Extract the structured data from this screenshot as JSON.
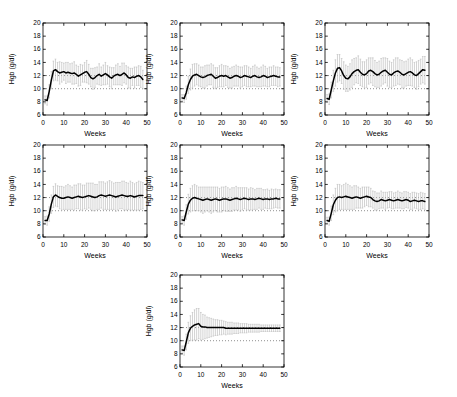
{
  "figure": {
    "background": "#ffffff",
    "axis_color": "#000000",
    "line_color": "#000000",
    "error_bar_color": "#c0c0c0",
    "reference_line_color": "#4a4a4a",
    "xlabel": "Weeks",
    "ylabel": "Hgb (g/dl)"
  },
  "chart_data": [
    {
      "type": "line",
      "xlabel": "Weeks",
      "ylabel": "Hgb (g/dl)",
      "xlim": [
        0,
        50
      ],
      "ylim": [
        6,
        20
      ],
      "xticks": [
        0,
        10,
        20,
        30,
        40,
        50
      ],
      "yticks": [
        6,
        8,
        10,
        12,
        14,
        16,
        18,
        20
      ],
      "reference_lines_y": [
        10,
        12
      ],
      "x": {
        "start": 1,
        "step": 1
      },
      "mean": [
        8.3,
        8.2,
        9.6,
        11.3,
        12.7,
        12.9,
        12.6,
        12.4,
        12.5,
        12.6,
        12.4,
        12.5,
        12.4,
        12.3,
        12.4,
        12.2,
        11.9,
        12.1,
        12.3,
        12.5,
        12.6,
        12.2,
        11.7,
        11.5,
        11.7,
        12.0,
        12.2,
        11.9,
        12.1,
        12.3,
        12.1,
        11.8,
        11.6,
        11.9,
        12.1,
        12.2,
        12.0,
        12.2,
        12.4,
        12.1,
        11.7,
        11.6,
        11.8,
        11.7,
        11.9,
        12.0,
        11.8,
        11.4
      ],
      "error_half_width": [
        0.6,
        0.7,
        1.0,
        1.3,
        1.5,
        1.6,
        1.4,
        1.7,
        1.5,
        1.3,
        1.6,
        1.5,
        1.4,
        1.6,
        1.7,
        1.4,
        1.5,
        1.6,
        1.3,
        1.5,
        1.7,
        1.5,
        1.4,
        1.6,
        1.5,
        1.3,
        1.6,
        1.4,
        1.5,
        1.7,
        1.4,
        1.5,
        1.6,
        1.3,
        1.5,
        1.6,
        1.4,
        1.7,
        1.5,
        1.4,
        1.6,
        1.5,
        1.3,
        1.6,
        1.4,
        1.5,
        1.6,
        1.4
      ]
    },
    {
      "type": "line",
      "xlabel": "Weeks",
      "ylabel": "Hgb (g/dl)",
      "xlim": [
        0,
        50
      ],
      "ylim": [
        6,
        20
      ],
      "xticks": [
        0,
        10,
        20,
        30,
        40,
        50
      ],
      "yticks": [
        6,
        8,
        10,
        12,
        14,
        16,
        18,
        20
      ],
      "reference_lines_y": [
        10,
        12
      ],
      "x": {
        "start": 1,
        "step": 1
      },
      "mean": [
        8.6,
        8.5,
        9.4,
        10.6,
        11.4,
        11.9,
        12.1,
        12.2,
        12.0,
        11.8,
        11.7,
        11.8,
        12.0,
        12.1,
        12.2,
        11.9,
        11.6,
        11.7,
        11.9,
        12.0,
        11.9,
        12.0,
        11.8,
        11.6,
        11.7,
        11.9,
        12.0,
        11.9,
        11.7,
        11.8,
        12.0,
        11.9,
        11.8,
        11.7,
        11.9,
        12.0,
        11.8,
        11.7,
        11.8,
        12.0,
        11.9,
        11.7,
        11.8,
        11.9,
        12.0,
        11.9,
        11.8,
        11.8
      ],
      "error_half_width": [
        0.5,
        0.6,
        1.0,
        1.3,
        1.6,
        1.8,
        1.7,
        1.6,
        1.6,
        1.5,
        1.6,
        1.7,
        1.6,
        1.5,
        1.6,
        1.7,
        1.6,
        1.5,
        1.6,
        1.7,
        1.6,
        1.5,
        1.6,
        1.5,
        1.6,
        1.5,
        1.6,
        1.5,
        1.6,
        1.5,
        1.5,
        1.6,
        1.5,
        1.4,
        1.5,
        1.6,
        1.5,
        1.4,
        1.5,
        1.6,
        1.5,
        1.4,
        1.5,
        1.4,
        1.5,
        1.4,
        1.5,
        1.4
      ]
    },
    {
      "type": "line",
      "xlabel": "Weeks",
      "ylabel": "Hgb (g/dl)",
      "xlim": [
        0,
        50
      ],
      "ylim": [
        6,
        20
      ],
      "xticks": [
        0,
        10,
        20,
        30,
        40,
        50
      ],
      "yticks": [
        6,
        8,
        10,
        12,
        14,
        16,
        18,
        20
      ],
      "reference_lines_y": [
        10,
        12
      ],
      "x": {
        "start": 1,
        "step": 1
      },
      "mean": [
        8.5,
        8.4,
        9.8,
        11.2,
        12.4,
        13.1,
        13.2,
        12.7,
        12.0,
        11.6,
        11.5,
        11.8,
        12.3,
        12.6,
        12.8,
        12.9,
        12.5,
        12.2,
        12.1,
        12.3,
        12.7,
        12.8,
        12.6,
        12.3,
        12.1,
        12.2,
        12.5,
        12.7,
        12.8,
        12.5,
        12.2,
        12.1,
        12.4,
        12.6,
        12.7,
        12.5,
        12.2,
        12.1,
        12.3,
        12.5,
        12.6,
        12.4,
        12.1,
        12.0,
        12.3,
        12.6,
        12.9,
        12.8
      ],
      "error_half_width": [
        0.6,
        0.8,
        1.2,
        1.6,
        2.0,
        2.1,
        2.0,
        1.9,
        2.1,
        2.0,
        1.9,
        2.0,
        2.1,
        2.0,
        1.9,
        2.1,
        2.0,
        1.9,
        2.0,
        2.1,
        2.0,
        1.9,
        2.1,
        2.0,
        1.9,
        2.0,
        2.1,
        2.0,
        1.9,
        2.1,
        2.0,
        1.9,
        2.0,
        2.1,
        2.0,
        1.9,
        2.1,
        2.0,
        1.9,
        2.0,
        2.1,
        2.0,
        1.9,
        2.1,
        2.0,
        1.9,
        2.0,
        2.1
      ]
    },
    {
      "type": "line",
      "xlabel": "Weeks",
      "ylabel": "Hgb (g/dl)",
      "xlim": [
        0,
        50
      ],
      "ylim": [
        6,
        20
      ],
      "xticks": [
        0,
        10,
        20,
        30,
        40,
        50
      ],
      "yticks": [
        6,
        8,
        10,
        12,
        14,
        16,
        18,
        20
      ],
      "reference_lines_y": [
        10,
        12
      ],
      "x": {
        "start": 1,
        "step": 1
      },
      "mean": [
        8.5,
        8.5,
        9.5,
        11.0,
        12.1,
        12.4,
        12.2,
        12.0,
        11.9,
        11.9,
        12.0,
        12.1,
        12.0,
        11.9,
        12.0,
        12.1,
        12.2,
        12.1,
        12.0,
        12.1,
        12.2,
        12.3,
        12.2,
        12.1,
        12.0,
        12.1,
        12.3,
        12.4,
        12.3,
        12.2,
        12.3,
        12.4,
        12.3,
        12.2,
        12.1,
        12.2,
        12.3,
        12.4,
        12.3,
        12.2,
        12.2,
        12.3,
        12.2,
        12.1,
        12.2,
        12.3,
        12.3,
        12.3
      ],
      "error_half_width": [
        0.6,
        0.7,
        1.1,
        1.4,
        1.6,
        1.7,
        1.6,
        1.7,
        1.8,
        1.7,
        1.8,
        1.9,
        1.8,
        1.7,
        1.9,
        1.8,
        1.9,
        2.0,
        1.9,
        1.8,
        2.0,
        1.9,
        2.0,
        2.1,
        2.0,
        1.9,
        2.1,
        2.0,
        2.1,
        2.0,
        2.1,
        2.2,
        2.1,
        2.0,
        2.2,
        2.1,
        2.0,
        2.1,
        2.2,
        2.1,
        2.0,
        2.2,
        2.1,
        2.0,
        2.1,
        2.2,
        2.1,
        2.0
      ]
    },
    {
      "type": "line",
      "xlabel": "Weeks",
      "ylabel": "Hgb (g/dl)",
      "xlim": [
        0,
        50
      ],
      "ylim": [
        6,
        20
      ],
      "xticks": [
        0,
        10,
        20,
        30,
        40,
        50
      ],
      "yticks": [
        6,
        8,
        10,
        12,
        14,
        16,
        18,
        20
      ],
      "reference_lines_y": [
        10,
        12
      ],
      "x": {
        "start": 1,
        "step": 1
      },
      "mean": [
        8.6,
        8.5,
        9.8,
        11.0,
        11.6,
        11.9,
        12.0,
        11.9,
        11.8,
        11.7,
        11.6,
        11.7,
        11.8,
        11.7,
        11.6,
        11.7,
        11.8,
        11.7,
        11.6,
        11.7,
        11.8,
        11.8,
        11.7,
        11.6,
        11.7,
        11.8,
        11.9,
        11.8,
        11.7,
        11.8,
        11.9,
        11.8,
        11.7,
        11.8,
        11.8,
        11.7,
        11.8,
        11.9,
        11.8,
        11.7,
        11.8,
        11.8,
        11.7,
        11.8,
        11.8,
        11.9,
        11.8,
        11.8
      ],
      "error_half_width": [
        0.5,
        0.7,
        1.1,
        1.5,
        1.8,
        1.9,
        2.0,
        1.9,
        1.8,
        1.9,
        2.0,
        1.9,
        1.8,
        1.9,
        2.0,
        1.9,
        1.8,
        1.9,
        1.8,
        1.9,
        1.8,
        1.9,
        1.8,
        1.7,
        1.8,
        1.7,
        1.8,
        1.7,
        1.8,
        1.7,
        1.6,
        1.7,
        1.6,
        1.7,
        1.6,
        1.5,
        1.6,
        1.5,
        1.6,
        1.5,
        1.4,
        1.5,
        1.4,
        1.5,
        1.4,
        1.4,
        1.4,
        1.4
      ]
    },
    {
      "type": "line",
      "xlabel": "Weeks",
      "ylabel": "Hgb (g/dl)",
      "xlim": [
        0,
        50
      ],
      "ylim": [
        6,
        20
      ],
      "xticks": [
        0,
        10,
        20,
        30,
        40,
        50
      ],
      "yticks": [
        6,
        8,
        10,
        12,
        14,
        16,
        18,
        20
      ],
      "reference_lines_y": [
        10,
        12
      ],
      "x": {
        "start": 1,
        "step": 1
      },
      "mean": [
        8.5,
        8.4,
        9.6,
        10.9,
        11.6,
        12.0,
        12.1,
        12.0,
        12.1,
        12.2,
        12.1,
        12.0,
        11.9,
        12.0,
        12.1,
        12.0,
        11.9,
        12.0,
        12.1,
        12.2,
        12.1,
        12.0,
        11.7,
        11.5,
        11.4,
        11.5,
        11.7,
        11.6,
        11.5,
        11.6,
        11.7,
        11.6,
        11.5,
        11.6,
        11.7,
        11.6,
        11.5,
        11.6,
        11.7,
        11.6,
        11.4,
        11.5,
        11.6,
        11.5,
        11.4,
        11.5,
        11.5,
        11.4
      ],
      "error_half_width": [
        0.5,
        0.6,
        1.1,
        1.5,
        1.8,
        2.0,
        1.9,
        1.8,
        1.9,
        2.0,
        1.9,
        1.8,
        1.7,
        1.8,
        1.7,
        1.6,
        1.5,
        1.6,
        1.5,
        1.4,
        1.5,
        1.4,
        1.3,
        1.4,
        1.3,
        1.2,
        1.3,
        1.2,
        1.3,
        1.2,
        1.2,
        1.3,
        1.2,
        1.2,
        1.3,
        1.2,
        1.2,
        1.3,
        1.2,
        1.2,
        1.2,
        1.3,
        1.2,
        1.2,
        1.2,
        1.3,
        1.2,
        1.2
      ]
    },
    {
      "type": "line",
      "xlabel": "Weeks",
      "ylabel": "Hgb (g/dl)",
      "xlim": [
        0,
        50
      ],
      "ylim": [
        6,
        20
      ],
      "xticks": [
        0,
        10,
        20,
        30,
        40,
        50
      ],
      "yticks": [
        6,
        8,
        10,
        12,
        14,
        16,
        18,
        20
      ],
      "reference_lines_y": [
        10,
        12
      ],
      "x": {
        "start": 1,
        "step": 1
      },
      "mean": [
        8.6,
        8.5,
        9.8,
        11.2,
        11.9,
        12.2,
        12.4,
        12.5,
        12.6,
        12.2,
        12.1,
        12.1,
        12.0,
        12.0,
        12.0,
        12.0,
        12.0,
        12.0,
        12.0,
        12.0,
        12.0,
        11.9,
        11.9,
        11.9,
        11.9,
        11.9,
        11.9,
        11.9,
        11.9,
        11.9,
        11.9,
        11.9,
        11.9,
        11.9,
        11.9,
        11.9,
        11.9,
        11.9,
        11.9,
        11.9,
        11.9,
        11.9,
        11.9,
        11.9,
        11.9,
        11.9,
        11.9,
        11.9
      ],
      "error_half_width": [
        0.6,
        0.7,
        1.2,
        1.6,
        1.9,
        2.1,
        2.3,
        2.4,
        2.3,
        2.1,
        1.9,
        1.8,
        1.6,
        1.5,
        1.4,
        1.3,
        1.2,
        1.2,
        1.1,
        1.1,
        1.0,
        1.0,
        0.9,
        0.9,
        0.9,
        0.8,
        0.8,
        0.8,
        0.7,
        0.7,
        0.7,
        0.7,
        0.6,
        0.6,
        0.6,
        0.6,
        0.6,
        0.6,
        0.5,
        0.5,
        0.5,
        0.5,
        0.5,
        0.5,
        0.5,
        0.5,
        0.5,
        0.5
      ]
    }
  ]
}
